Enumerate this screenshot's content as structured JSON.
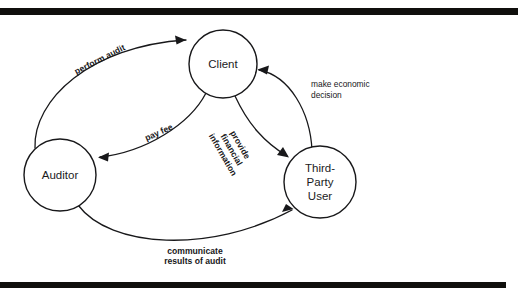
{
  "diagram": {
    "background_color": "#ffffff",
    "ink_color": "#18181a",
    "scan_bar_color": "#100f0d",
    "nodes": [
      {
        "id": "client",
        "lines": [
          "Client"
        ],
        "cx": 223,
        "cy": 64,
        "r": 34
      },
      {
        "id": "auditor",
        "lines": [
          "Auditor"
        ],
        "cx": 60,
        "cy": 175,
        "r": 36
      },
      {
        "id": "third-party-user",
        "lines": [
          "Third-",
          "Party",
          "User"
        ],
        "cx": 320,
        "cy": 182,
        "r": 36
      }
    ],
    "edges": [
      {
        "id": "perform-audit",
        "from": "auditor",
        "to": "client",
        "label_lines": [
          "perform audit"
        ],
        "label_rotation": -27,
        "label_x": 100,
        "label_y": 60,
        "style": "bold-rotated"
      },
      {
        "id": "pay-fee",
        "from": "client",
        "to": "auditor",
        "label_lines": [
          "pay fee"
        ],
        "label_rotation": -24,
        "label_x": 159,
        "label_y": 133,
        "style": "bold-rotated"
      },
      {
        "id": "provide-financial-information",
        "from": "client",
        "to": "third-party-user",
        "label_lines": [
          "provide",
          "financial",
          "information"
        ],
        "label_rotation": 60,
        "label_x": 231,
        "label_y": 150,
        "style": "bold-rotated"
      },
      {
        "id": "make-economic-decision",
        "from": "third-party-user",
        "to": "client",
        "label_lines": [
          "make economic",
          "decision"
        ],
        "label_rotation": 0,
        "label_x": 311,
        "label_y": 87,
        "style": "plain-horizontal"
      },
      {
        "id": "communicate-results-of-audit",
        "from": "auditor",
        "to": "third-party-user",
        "label_lines": [
          "communicate",
          "results of audit"
        ],
        "label_rotation": 0,
        "label_x": 195,
        "label_y": 256,
        "style": "bold-horizontal"
      }
    ]
  }
}
